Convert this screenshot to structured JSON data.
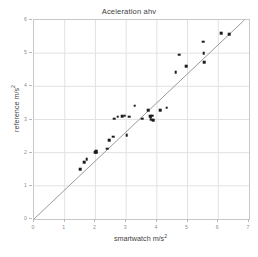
{
  "chart_data": {
    "type": "scatter",
    "title": "Aceleration ahv",
    "xlabel_text": "smartwatch m/s",
    "xlabel_sup": "2",
    "ylabel_text": "reference m/s",
    "ylabel_sup": "2",
    "xlim": [
      0,
      7
    ],
    "ylim": [
      0,
      6
    ],
    "xticks": [
      0,
      1,
      2,
      3,
      4,
      5,
      6,
      7
    ],
    "yticks": [
      0,
      1,
      2,
      3,
      4,
      5,
      6
    ],
    "grid": true,
    "legend": "none",
    "marker_color": "#1b1b1b",
    "marker_shape": "square",
    "grid_color": "#e2e2e2",
    "frame_color": "#c8c8c8",
    "reference_line": {
      "label": "identity line y = x",
      "color": "#9a9a9a",
      "x": [
        0,
        6.85
      ],
      "y": [
        0,
        6.0
      ]
    },
    "x": [
      1.5,
      1.63,
      1.72,
      2.0,
      2.02,
      2.02,
      2.38,
      2.45,
      2.58,
      2.62,
      2.72,
      2.88,
      2.95,
      3.02,
      3.1,
      3.28,
      3.52,
      3.72,
      3.78,
      3.8,
      3.82,
      3.85,
      3.88,
      4.1,
      4.32,
      4.62,
      4.72,
      4.95,
      5.5,
      5.52,
      5.55,
      6.1,
      6.35
    ],
    "y": [
      1.5,
      1.72,
      1.8,
      2.02,
      2.05,
      2.0,
      2.12,
      2.38,
      2.48,
      3.02,
      3.08,
      3.1,
      3.12,
      2.52,
      3.08,
      3.42,
      3.02,
      3.28,
      3.1,
      3.05,
      3.0,
      3.12,
      2.98,
      3.28,
      3.35,
      4.42,
      4.95,
      4.6,
      5.35,
      5.0,
      4.72,
      5.6,
      5.58
    ],
    "series": [
      {
        "name": "measurements",
        "points": [
          [
            1.5,
            1.5
          ],
          [
            1.63,
            1.72
          ],
          [
            1.72,
            1.8
          ],
          [
            2.0,
            2.02
          ],
          [
            2.02,
            2.05
          ],
          [
            2.02,
            2.0
          ],
          [
            2.38,
            2.12
          ],
          [
            2.45,
            2.38
          ],
          [
            2.58,
            2.48
          ],
          [
            2.62,
            3.02
          ],
          [
            2.72,
            3.08
          ],
          [
            2.88,
            3.1
          ],
          [
            2.95,
            3.12
          ],
          [
            3.02,
            2.52
          ],
          [
            3.1,
            3.08
          ],
          [
            3.28,
            3.42
          ],
          [
            3.52,
            3.02
          ],
          [
            3.72,
            3.28
          ],
          [
            3.78,
            3.1
          ],
          [
            3.8,
            3.05
          ],
          [
            3.82,
            3.0
          ],
          [
            3.85,
            3.12
          ],
          [
            3.88,
            2.98
          ],
          [
            4.1,
            3.28
          ],
          [
            4.32,
            3.35
          ],
          [
            4.62,
            4.42
          ],
          [
            4.72,
            4.95
          ],
          [
            4.95,
            4.6
          ],
          [
            5.5,
            5.35
          ],
          [
            5.52,
            5.0
          ],
          [
            5.55,
            4.72
          ],
          [
            6.1,
            5.6
          ],
          [
            6.35,
            5.58
          ]
        ]
      }
    ]
  }
}
